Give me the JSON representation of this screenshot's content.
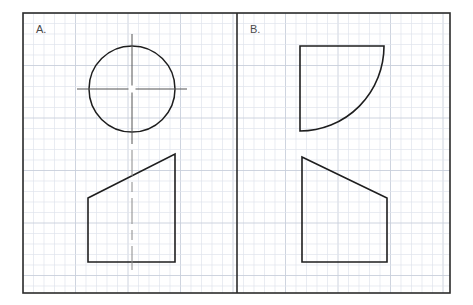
{
  "sheet": {
    "background_color": "#ffffff",
    "width": 473,
    "height": 305,
    "border": {
      "x": 23,
      "y": 13,
      "width": 427,
      "height": 280,
      "color": "#2b2b2b",
      "stroke_width": 1.6
    },
    "grid": {
      "cell_size": 10.5,
      "minor_color": "#dfe4ec",
      "major_color": "#c8cfdb",
      "major_every": 5,
      "visible": true
    },
    "divider": {
      "x": 237,
      "color": "#2b2b2b",
      "stroke_width": 1.6
    }
  },
  "panels": [
    {
      "id": "panel-a",
      "label": "A.",
      "label_x": 36,
      "label_y": 33,
      "shapes": [
        {
          "name": "circle",
          "type": "circle",
          "cx": 132,
          "cy": 89,
          "r": 43,
          "stroke": "#1e1e1e",
          "stroke_width": 1.5,
          "fill": "none"
        },
        {
          "name": "centerline-horizontal",
          "type": "centerline",
          "orientation": "horizontal",
          "x1": 77,
          "y1": 89,
          "x2": 187,
          "y2": 89,
          "stroke": "#555555",
          "stroke_width": 1,
          "dash": "none"
        },
        {
          "name": "centerline-vertical",
          "type": "centerline",
          "orientation": "vertical",
          "x1": 132,
          "y1": 34,
          "x2": 132,
          "y2": 144,
          "stroke": "#555555",
          "stroke_width": 1,
          "dash": "none"
        },
        {
          "name": "center-gap-mark",
          "type": "gap",
          "cx": 132,
          "cy": 89,
          "size": 7,
          "color": "#ffffff"
        },
        {
          "name": "trapezoid",
          "type": "polygon",
          "points": "88,198 175,154 175,262 88,262",
          "stroke": "#1e1e1e",
          "stroke_width": 1.6,
          "fill": "none"
        },
        {
          "name": "trapezoid-centerline",
          "type": "centerline",
          "orientation": "vertical",
          "x1": 132,
          "y1": 150,
          "x2": 132,
          "y2": 270,
          "stroke": "#8a8a8a",
          "stroke_width": 1,
          "dash": "26 6 10 6"
        }
      ]
    },
    {
      "id": "panel-b",
      "label": "B.",
      "label_x": 250,
      "label_y": 33,
      "shapes": [
        {
          "name": "quarter-round-profile",
          "type": "path",
          "d": "M 300 46 L 384 46 A 84 85 0 0 1 300 131 Z",
          "stroke": "#1e1e1e",
          "stroke_width": 1.6,
          "fill": "none"
        },
        {
          "name": "trapezoid",
          "type": "polygon",
          "points": "302,157 387,198 387,262 302,262",
          "stroke": "#1e1e1e",
          "stroke_width": 1.6,
          "fill": "none"
        }
      ]
    }
  ]
}
